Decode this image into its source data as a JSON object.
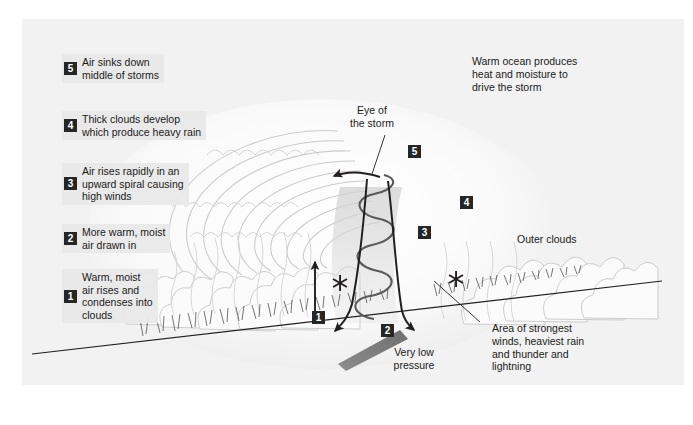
{
  "figure": {
    "background_color": "#f2f2f2",
    "marker_color": "#262626",
    "ink_color": "#231f20",
    "cloud_color": "#d8d8d8",
    "pressure_arrow_color": "#7a7a7a"
  },
  "steps": [
    {
      "number": "5",
      "text": "Air sinks down\nmiddle of storms"
    },
    {
      "number": "4",
      "text": "Thick clouds develop\nwhich produce heavy rain"
    },
    {
      "number": "3",
      "text": "Air rises rapidly in an\nupward spiral causing\nhigh winds"
    },
    {
      "number": "2",
      "text": "More warm, moist\nair drawn in"
    },
    {
      "number": "1",
      "text": "Warm, moist\nair rises and\ncondenses into\nclouds"
    }
  ],
  "annotations": {
    "warm_ocean": "Warm ocean produces\nheat and moisture to\ndrive the storm",
    "eye_of_storm": "Eye of\nthe storm",
    "outer_clouds": "Outer clouds",
    "very_low_pressure": "Very low\npressure",
    "strongest_winds": "Area of strongest\nwinds, heaviest rain\nand thunder and\nlightning"
  },
  "diagram_markers": {
    "m1": "1",
    "m2": "2",
    "m3": "3",
    "m4": "4",
    "m5": "5"
  },
  "caption": ""
}
